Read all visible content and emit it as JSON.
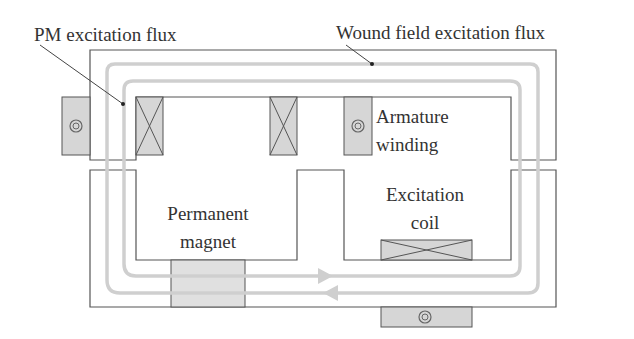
{
  "diagram": {
    "labels": {
      "pm_flux": "PM excitation flux",
      "wound_flux": "Wound field excitation flux",
      "armature_line1": "Armature",
      "armature_line2": "winding",
      "excitation_line1": "Excitation",
      "excitation_line2": "coil",
      "pm_line1": "Permanent",
      "pm_line2": "magnet"
    },
    "colors": {
      "outline": "#555555",
      "coil_fill": "#d6d6d6",
      "magnet_fill": "#e0e0e0",
      "flux_path": "#cfcfcf",
      "text": "#333333"
    }
  }
}
